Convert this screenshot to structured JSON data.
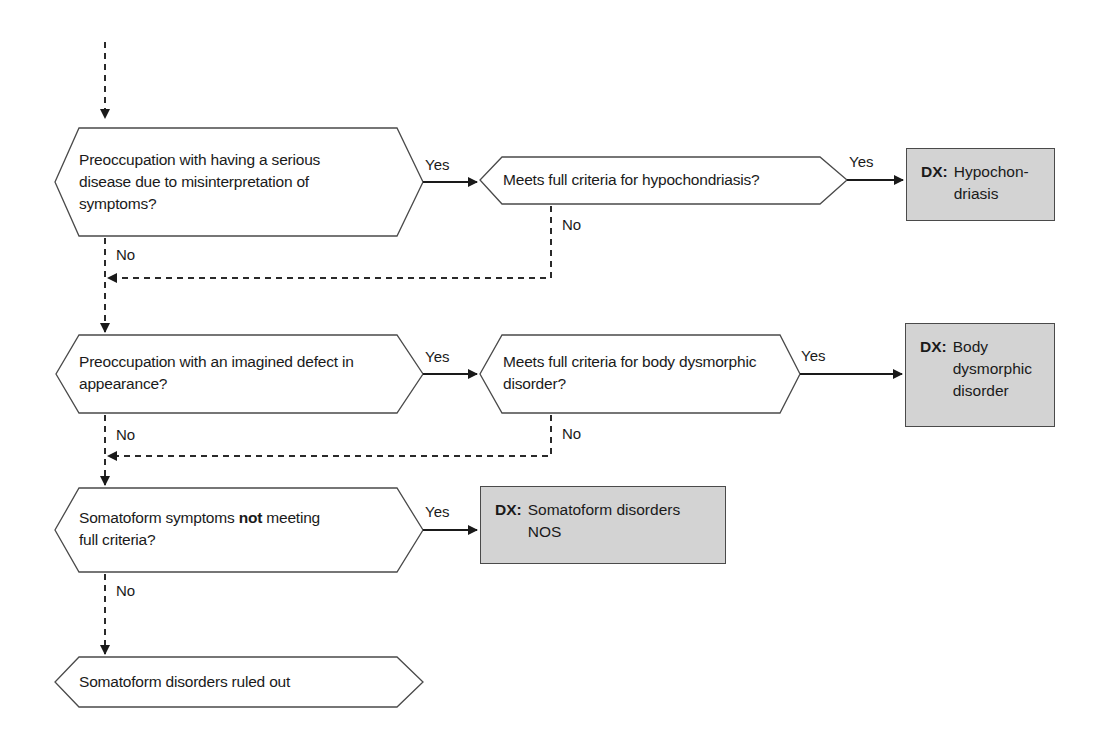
{
  "diagram": {
    "type": "flowchart",
    "decisions": [
      {
        "id": "d1",
        "text": "Preoccupation with having a serious disease due to misinterpretation of symptoms?",
        "lines": [
          "Preoccupation with having a serious",
          "disease due to misinterpretation of",
          "symptoms?"
        ],
        "yes_label": "Yes",
        "no_label": "No"
      },
      {
        "id": "d1b",
        "text": "Meets full criteria for hypochondriasis?",
        "lines": [
          "Meets full criteria for hypochondriasis?"
        ],
        "yes_label": "Yes",
        "no_label": "No"
      },
      {
        "id": "d2",
        "text": "Preoccupation with an imagined defect in appearance?",
        "lines": [
          "Preoccupation with an imagined defect in",
          "appearance?"
        ],
        "yes_label": "Yes",
        "no_label": "No"
      },
      {
        "id": "d2b",
        "text": "Meets full criteria for body dysmorphic disorder?",
        "lines": [
          "Meets full criteria for body dysmorphic",
          "disorder?"
        ],
        "yes_label": "Yes",
        "no_label": "No"
      },
      {
        "id": "d3",
        "text": "Somatoform symptoms not meeting full criteria?",
        "line1_pre": "Somatoform symptoms ",
        "line1_bold": "not",
        "line1_post": " meeting",
        "line2": "full criteria?",
        "yes_label": "Yes",
        "no_label": "No"
      }
    ],
    "outcomes": [
      {
        "id": "dx1",
        "tag": "DX:",
        "text": "Hypochon-\ndriasis"
      },
      {
        "id": "dx2",
        "tag": "DX:",
        "text": "Body\ndysmorphic\ndisorder"
      },
      {
        "id": "dx3",
        "tag": "DX:",
        "text": "Somatoform disorders\nNOS"
      }
    ],
    "terminal": {
      "id": "end",
      "text": "Somatoform disorders ruled out"
    },
    "colors": {
      "line": "#2a2a2a",
      "dx_fill": "#d3d3d3",
      "node_fill": "#ffffff"
    }
  }
}
